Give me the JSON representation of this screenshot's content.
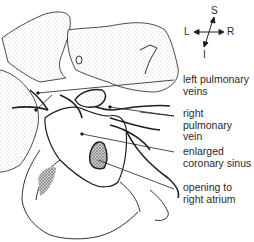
{
  "figure": {
    "type": "anatomical-illustration",
    "colors": {
      "line": "#1e1e1e",
      "stipple": "#b8b8b8",
      "dark_fill": "#6a6a6a",
      "text": "#2a2a2a"
    }
  },
  "compass": {
    "superior": "S",
    "inferior": "I",
    "left": "L",
    "right": "R"
  },
  "labels": [
    {
      "id": "left-pulmonary-veins",
      "text": "left pulmonary\nveins"
    },
    {
      "id": "right-pulmonary-vein",
      "text": "right\npulmonary\nvein"
    },
    {
      "id": "enlarged-coronary-sinus",
      "text": "enlarged\ncoronary sinus"
    },
    {
      "id": "opening-to-right-atrium",
      "text": "opening to\nright atrium"
    }
  ]
}
